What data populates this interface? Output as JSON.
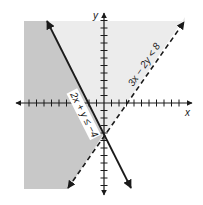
{
  "figure": {
    "type": "system-of-inequalities-graph",
    "axes": {
      "x_label": "x",
      "y_label": "y",
      "origin_px": [
        104,
        103
      ],
      "unit_px": 7.5,
      "x_range": [
        -10,
        10
      ],
      "y_range": [
        -11,
        11
      ]
    },
    "inequalities": [
      {
        "label": "2x + y ≤ −4",
        "boundary": "2x + y = −4",
        "line_style": "solid",
        "shaded_side": "left/below"
      },
      {
        "label": "3x − 2y < 8",
        "boundary": "3x − 2y = 8",
        "line_style": "dashed",
        "shaded_side": "above/left"
      }
    ],
    "intersection_point": [
      0,
      -4
    ],
    "colors": {
      "solution_region": "#c8c8c8",
      "partial_region": "#ececec",
      "lines": "#1a1a1a",
      "background": "#ffffff"
    }
  }
}
